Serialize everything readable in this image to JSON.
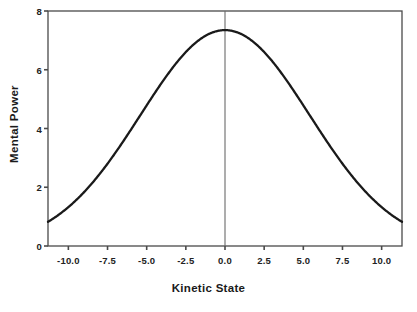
{
  "chart_data": {
    "type": "line",
    "title": "",
    "subtitle": "",
    "xlabel": "Kinetic State",
    "ylabel": "Mental Power",
    "xlim": [
      -11.3,
      11.3
    ],
    "ylim": [
      0,
      8
    ],
    "xticks": [
      "-10.0",
      "-7.5",
      "-5.0",
      "-2.5",
      "0.0",
      "2.5",
      "5.0",
      "7.5",
      "10.0"
    ],
    "xtick_values": [
      -10.0,
      -7.5,
      -5.0,
      -2.5,
      0.0,
      2.5,
      5.0,
      7.5,
      10.0
    ],
    "yticks": [
      "0",
      "2",
      "4",
      "6",
      "8"
    ],
    "ytick_values": [
      0,
      2,
      4,
      6,
      8
    ],
    "grid": false,
    "legend": null,
    "annotations": [
      {
        "name": "zero-reference-line",
        "type": "vline",
        "x": 0.0
      }
    ],
    "series": [
      {
        "name": "mental-power-curve",
        "color": "#1a1a1a",
        "line_width": 2.2,
        "shape": "gaussian",
        "peak_x": 0.0,
        "peak_y": 7.35,
        "sigma": 5.4,
        "x": [
          -11.3,
          -11.0,
          -10.5,
          -10.0,
          -9.5,
          -9.0,
          -8.5,
          -8.0,
          -7.5,
          -7.0,
          -6.5,
          -6.0,
          -5.5,
          -5.0,
          -4.5,
          -4.0,
          -3.5,
          -3.0,
          -2.5,
          -2.0,
          -1.5,
          -1.0,
          -0.5,
          0.0,
          0.5,
          1.0,
          1.5,
          2.0,
          2.5,
          3.0,
          3.5,
          4.0,
          4.5,
          5.0,
          5.5,
          6.0,
          6.5,
          7.0,
          7.5,
          8.0,
          8.5,
          9.0,
          9.5,
          10.0,
          10.5,
          11.0,
          11.3
        ],
        "y": [
          0.45,
          0.49,
          0.58,
          0.68,
          0.8,
          0.93,
          1.08,
          1.25,
          1.44,
          1.65,
          1.88,
          2.13,
          2.4,
          2.69,
          2.99,
          3.31,
          3.64,
          3.98,
          4.32,
          4.66,
          4.98,
          5.29,
          5.58,
          7.35,
          5.58,
          5.29,
          4.98,
          4.66,
          4.32,
          3.98,
          3.64,
          3.31,
          2.99,
          2.69,
          2.4,
          2.13,
          1.88,
          1.65,
          1.44,
          1.25,
          1.08,
          0.93,
          0.8,
          0.68,
          0.58,
          0.49,
          0.45
        ]
      }
    ]
  },
  "axes": {
    "x_title": "Kinetic State",
    "y_title": "Mental Power",
    "x_tick_labels": [
      "-10.0",
      "-7.5",
      "-5.0",
      "-2.5",
      "0.0",
      "2.5",
      "5.0",
      "7.5",
      "10.0"
    ],
    "y_tick_labels": [
      "0",
      "2",
      "4",
      "6",
      "8"
    ]
  },
  "style": {
    "background": "#ffffff",
    "frame_color": "#4a4a4a",
    "curve_color": "#1a1a1a",
    "reference_line_color": "#6a6a6a",
    "text_color": "#1a1a1a"
  }
}
